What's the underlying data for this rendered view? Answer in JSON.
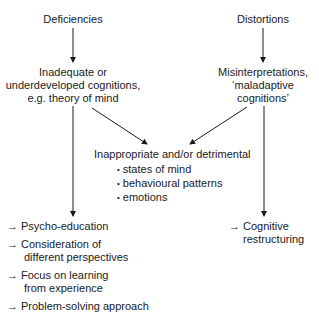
{
  "diagram": {
    "left_branch": {
      "source": "Deficiencies",
      "node_lines": [
        "Inadequate or",
        "underdeveloped cognitions,",
        "e.g. theory of mind"
      ]
    },
    "right_branch": {
      "source": "Distortions",
      "node_lines": [
        "Misinterpretations,",
        "‘maladaptive",
        "cognitions’"
      ]
    },
    "center": {
      "heading": "Inappropriate and/or detrimental",
      "bullets": [
        "states of mind",
        "behavioural patterns",
        "emotions"
      ]
    },
    "left_interventions": {
      "arrow_glyph": "→",
      "items": [
        {
          "lines": [
            "Psycho-education"
          ]
        },
        {
          "lines": [
            "Consideration of",
            "different perspectives"
          ]
        },
        {
          "lines": [
            "Focus on learning",
            "from experience"
          ]
        },
        {
          "lines": [
            "Problem-solving approach"
          ]
        }
      ]
    },
    "right_interventions": {
      "arrow_glyph": "→",
      "items": [
        {
          "lines": [
            "Cognitive",
            "restructuring"
          ]
        }
      ]
    }
  }
}
